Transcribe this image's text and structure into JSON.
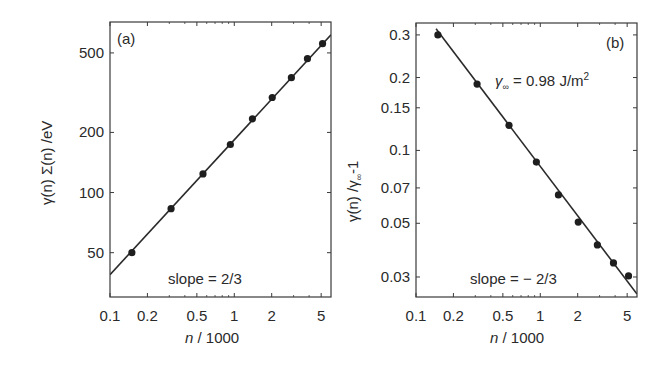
{
  "chart_data": [
    {
      "type": "scatter",
      "panel_label": "(a)",
      "title": "",
      "xlabel": "n / 1000",
      "ylabel": "γ(n) Σ(n) /eV",
      "xscale": "log",
      "yscale": "log",
      "xlim": [
        0.1,
        6.0
      ],
      "ylim": [
        30,
        714
      ],
      "xticks": [
        0.1,
        0.2,
        0.5,
        1,
        2,
        5
      ],
      "xtick_labels": [
        "0.1",
        "0.2",
        "0.5",
        "1",
        "2",
        "5"
      ],
      "yticks": [
        50,
        100,
        200,
        500
      ],
      "ytick_labels": [
        "50",
        "100",
        "200",
        "500"
      ],
      "grid": false,
      "series": [
        {
          "name": "data",
          "marker": "filled-circle",
          "x": [
            0.15,
            0.31,
            0.56,
            0.93,
            1.4,
            2.02,
            2.88,
            3.88,
            5.13
          ],
          "y": [
            50,
            83,
            124,
            174,
            234,
            299,
            376,
            468,
            556
          ]
        },
        {
          "name": "fit",
          "style": "line",
          "x": [
            0.1,
            6.0
          ],
          "y": [
            38.8,
            616
          ]
        }
      ],
      "annotations": [
        {
          "text": "slope = 2/3",
          "x": 0.6,
          "y": 37
        }
      ]
    },
    {
      "type": "scatter",
      "panel_label": "(b)",
      "title": "",
      "xlabel": "n / 1000",
      "ylabel": "γ(n) /γ∞-1",
      "xscale": "log",
      "yscale": "log",
      "xlim": [
        0.1,
        6.0
      ],
      "ylim": [
        0.0248,
        0.336
      ],
      "xticks": [
        0.1,
        0.2,
        0.5,
        1,
        2,
        5
      ],
      "xtick_labels": [
        "0.1",
        "0.2",
        "0.5",
        "1",
        "2",
        "5"
      ],
      "yticks": [
        0.03,
        0.05,
        0.07,
        0.1,
        0.15,
        0.2,
        0.3
      ],
      "ytick_labels": [
        "0.03",
        "0.05",
        "0.07",
        "0.1",
        "0.15",
        "0.2",
        "0.3"
      ],
      "grid": false,
      "series": [
        {
          "name": "data",
          "marker": "filled-circle",
          "x": [
            0.15,
            0.31,
            0.56,
            0.93,
            1.4,
            2.02,
            2.88,
            3.88,
            5.13
          ],
          "y": [
            0.3,
            0.188,
            0.127,
            0.0895,
            0.0655,
            0.0506,
            0.0407,
            0.0343,
            0.0303
          ]
        },
        {
          "name": "fit",
          "style": "line",
          "x": [
            0.145,
            6.0
          ],
          "y": [
            0.318,
            0.0255
          ]
        }
      ],
      "annotations": [
        {
          "text": "γ∞ = 0.98 J/m²",
          "x": 1.2,
          "y": 0.19
        },
        {
          "text": "slope = − 2/3",
          "x": 0.75,
          "y": 0.03
        }
      ]
    }
  ],
  "panels": {
    "a": {
      "label": "(a)",
      "ylabel_gamma": "γ(n) Σ(n) /eV",
      "xlabel_n": "n",
      "xlabel_rest": " / 1000",
      "slope_text": "slope = 2/3"
    },
    "b": {
      "label": "(b)",
      "ylabel_main": "γ(n) /γ",
      "ylabel_sub": "∞",
      "ylabel_tail": "-1",
      "xlabel_n": "n",
      "xlabel_rest": " / 1000",
      "gamma_inf_sym": "γ",
      "gamma_inf_sub": "∞",
      "gamma_inf_value": " = 0.98 J/m",
      "gamma_inf_sup": "2",
      "slope_text": "slope = − 2/3"
    }
  },
  "colors": {
    "line": "#2a2a2a",
    "marker": "#1e1e1e",
    "frame": "#3a3a3a",
    "text": "#2a2a2a"
  }
}
